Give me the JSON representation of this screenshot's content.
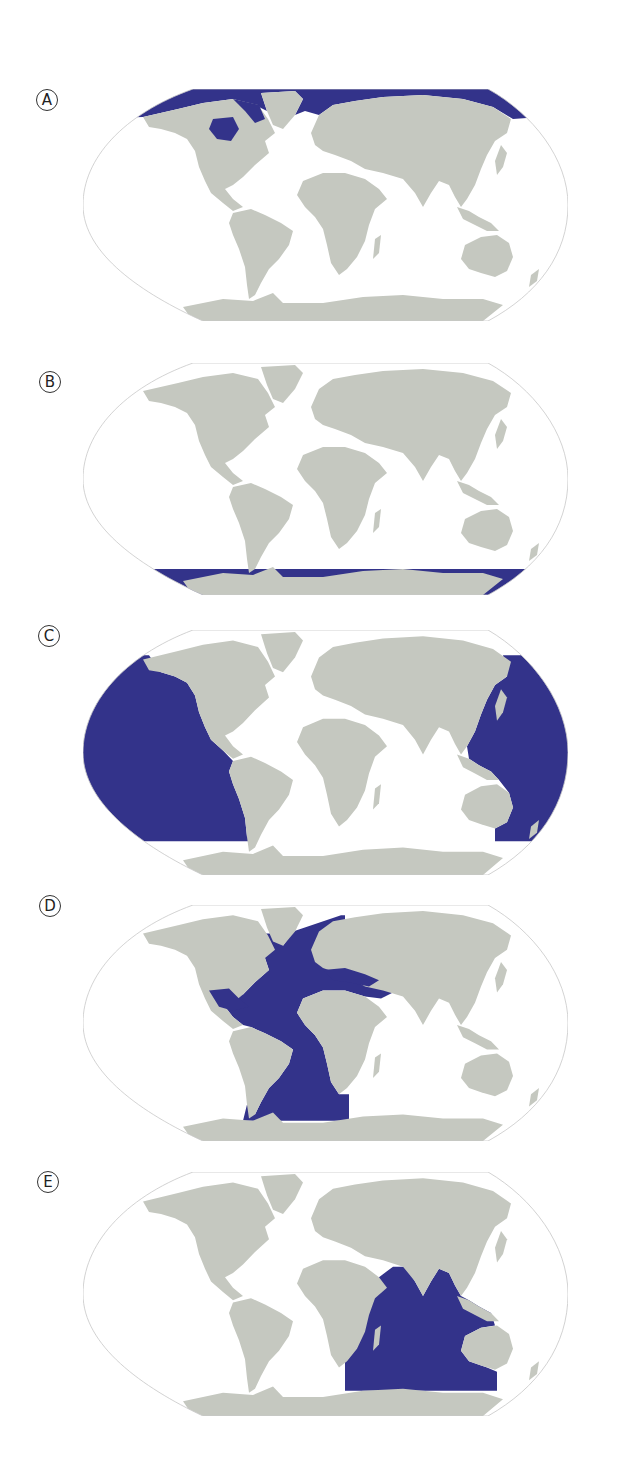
{
  "colors": {
    "ocean_highlight": "#33338a",
    "land": "#c5c8c0",
    "background": "#ffffff",
    "outline": "#c8c8c8"
  },
  "panels": [
    {
      "label": "A",
      "highlighted_region": "Arctic Ocean",
      "highlight": "arctic"
    },
    {
      "label": "B",
      "highlighted_region": "Southern Ocean",
      "highlight": "southern"
    },
    {
      "label": "C",
      "highlighted_region": "Pacific Ocean",
      "highlight": "pacific"
    },
    {
      "label": "D",
      "highlighted_region": "Atlantic Ocean",
      "highlight": "atlantic"
    },
    {
      "label": "E",
      "highlighted_region": "Indian Ocean",
      "highlight": "indian"
    }
  ]
}
